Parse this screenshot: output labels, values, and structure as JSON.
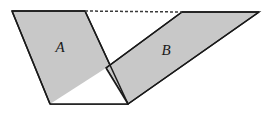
{
  "figure": {
    "kind": "geometry-diagram",
    "canvas": {
      "width": 266,
      "height": 115,
      "background": "#ffffff"
    },
    "style": {
      "fill": "#c8c8c8",
      "stroke": "#1a1a1a",
      "stroke_width": 1.5,
      "white_fill": "#ffffff",
      "dash_stroke": "#3a3a3a",
      "dash_pattern": "3 2",
      "dash_width": 1.5
    },
    "labels": [
      {
        "name": "label-a",
        "text": "A",
        "x": 60,
        "y": 49,
        "style": "italic-serif"
      },
      {
        "name": "label-b",
        "text": "B",
        "x": 166,
        "y": 52,
        "style": "italic-serif"
      }
    ],
    "shapes": [
      {
        "name": "parallelogram-a",
        "label": "A",
        "filled": true,
        "points": "12,11 85,11 128,104 50,104"
      },
      {
        "name": "parallelogram-b",
        "label": "B",
        "filled": true,
        "points": "182,12 259,12 128,104 106,68"
      },
      {
        "name": "white-triangle",
        "label": "",
        "filled": false,
        "points": "50,104 128,104 106,68"
      }
    ],
    "edges": [
      {
        "name": "edge-a-top",
        "x1": 12,
        "y1": 11,
        "x2": 85,
        "y2": 11
      },
      {
        "name": "edge-a-left",
        "x1": 12,
        "y1": 11,
        "x2": 50,
        "y2": 104
      },
      {
        "name": "edge-a-right",
        "x1": 85,
        "y1": 11,
        "x2": 128,
        "y2": 104
      },
      {
        "name": "edge-a-bottom",
        "x1": 50,
        "y1": 104,
        "x2": 128,
        "y2": 104
      },
      {
        "name": "edge-b-top",
        "x1": 182,
        "y1": 12,
        "x2": 259,
        "y2": 12
      },
      {
        "name": "edge-b-upper-left",
        "x1": 182,
        "y1": 12,
        "x2": 106,
        "y2": 68
      },
      {
        "name": "edge-b-lower-left",
        "x1": 106,
        "y1": 68,
        "x2": 128,
        "y2": 104
      },
      {
        "name": "edge-b-bottom",
        "x1": 128,
        "y1": 104,
        "x2": 259,
        "y2": 12
      }
    ],
    "dashed_line": {
      "name": "dashed-connector",
      "x1": 85,
      "y1": 11,
      "x2": 182,
      "y2": 12
    },
    "vertices": [
      {
        "name": "vertex-a-top-left",
        "x": 12,
        "y": 11
      },
      {
        "name": "vertex-a-top-right",
        "x": 85,
        "y": 11
      },
      {
        "name": "vertex-a-bottom-left",
        "x": 50,
        "y": 104
      },
      {
        "name": "vertex-shared-bottom",
        "x": 128,
        "y": 104
      },
      {
        "name": "vertex-b-top-left",
        "x": 182,
        "y": 12
      },
      {
        "name": "vertex-b-top-right",
        "x": 259,
        "y": 12
      },
      {
        "name": "vertex-crossing",
        "x": 106,
        "y": 68
      }
    ]
  }
}
